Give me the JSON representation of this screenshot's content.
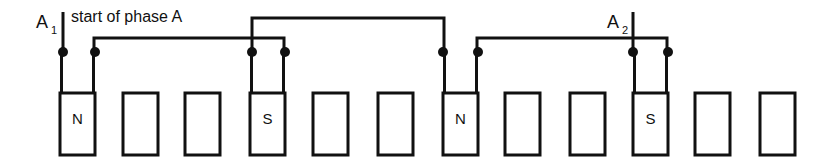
{
  "diagram": {
    "title": "start of phase A",
    "type": "stator-winding-schematic",
    "annotation": "start of phase A",
    "line_color": "#111111",
    "background_color": "#ffffff",
    "terminals": [
      {
        "id": "A1",
        "base": "A",
        "subscript": "1",
        "x": 63,
        "label": "A₁"
      },
      {
        "id": "A2",
        "base": "A",
        "subscript": "2",
        "x": 633,
        "label": "A₂"
      }
    ],
    "slots": [
      {
        "index": 1,
        "pole": "N",
        "energized": true,
        "x": 60,
        "width": 35
      },
      {
        "index": 2,
        "pole": "",
        "energized": false,
        "x": 123,
        "width": 35
      },
      {
        "index": 3,
        "pole": "",
        "energized": false,
        "x": 185,
        "width": 35
      },
      {
        "index": 4,
        "pole": "S",
        "energized": true,
        "x": 250,
        "width": 35
      },
      {
        "index": 5,
        "pole": "",
        "energized": false,
        "x": 313,
        "width": 35
      },
      {
        "index": 6,
        "pole": "",
        "energized": false,
        "x": 378,
        "width": 35
      },
      {
        "index": 7,
        "pole": "N",
        "energized": true,
        "x": 443,
        "width": 35
      },
      {
        "index": 8,
        "pole": "",
        "energized": false,
        "x": 505,
        "width": 35
      },
      {
        "index": 9,
        "pole": "",
        "energized": false,
        "x": 570,
        "width": 35
      },
      {
        "index": 10,
        "pole": "S",
        "energized": true,
        "x": 633,
        "width": 35
      },
      {
        "index": 11,
        "pole": "",
        "energized": false,
        "x": 695,
        "width": 35
      },
      {
        "index": 12,
        "pole": "",
        "energized": false,
        "x": 760,
        "width": 35
      }
    ],
    "junction_dots": [
      {
        "x": 63,
        "y": 52
      },
      {
        "x": 95,
        "y": 52
      },
      {
        "x": 252,
        "y": 52
      },
      {
        "x": 285,
        "y": 52
      },
      {
        "x": 443,
        "y": 52
      },
      {
        "x": 478,
        "y": 52
      },
      {
        "x": 633,
        "y": 52
      },
      {
        "x": 668,
        "y": 52
      }
    ],
    "connections": [
      {
        "from": "slot1-right",
        "to": "slot4-right",
        "route_y": 38
      },
      {
        "from": "slot4-left",
        "to": "slot7-left",
        "route_y": 18
      },
      {
        "from": "slot7-right",
        "to": "slot10-right",
        "route_y": 38
      }
    ],
    "pole_sequence": [
      "N",
      "S",
      "N",
      "S"
    ]
  }
}
